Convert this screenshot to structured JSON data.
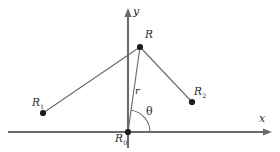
{
  "figure": {
    "background_color": "#ffffff",
    "line_color": "#6b6b6b",
    "dot_color": "#1c1c1c",
    "label_color": "#2a2a2a",
    "width": 280,
    "height": 152
  },
  "axes": {
    "x": {
      "label": "x",
      "label_name": "x-axis-label",
      "orientation": "horizontal",
      "arrow_direction": "right",
      "y_position": 132,
      "x_start": 8,
      "x_end": 272
    },
    "y": {
      "label": "y",
      "label_name": "y-axis-label",
      "orientation": "vertical",
      "arrow_direction": "up",
      "x_position": 128,
      "y_start": 148,
      "y_end": 8
    }
  },
  "points": [
    {
      "id": "origin",
      "label_main": "R",
      "label_sub": "0",
      "x": 128,
      "y": 132,
      "dot_radius": 3.1
    },
    {
      "id": "field-point",
      "label_main": "R",
      "label_sub": "",
      "x": 140,
      "y": 47,
      "dot_radius": 3.1
    },
    {
      "id": "source-one",
      "label_main": "R",
      "label_sub": "1",
      "x": 43,
      "y": 113,
      "dot_radius": 3.1
    },
    {
      "id": "source-two",
      "label_main": "R",
      "label_sub": "2",
      "x": 192,
      "y": 102,
      "dot_radius": 3.1
    }
  ],
  "segments": [
    {
      "id": "origin-to-r",
      "from": "origin",
      "to": "field-point",
      "style": "radial",
      "label": "r"
    },
    {
      "id": "r-to-r1",
      "from": "field-point",
      "to": "source-one",
      "style": "connector",
      "label": ""
    },
    {
      "id": "r-to-r2",
      "from": "field-point",
      "to": "source-two",
      "style": "connector",
      "label": ""
    }
  ],
  "annotations": {
    "radius": {
      "label": "r",
      "description": "radial distance from origin to point R"
    },
    "angle": {
      "label": "θ",
      "description": "angle measured from positive x-axis to radial line r",
      "arc_radius": 22
    }
  }
}
